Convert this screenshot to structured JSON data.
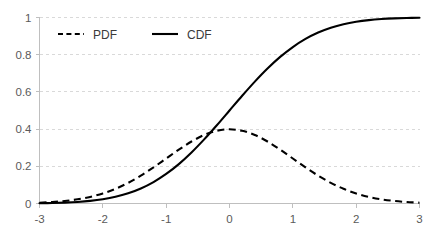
{
  "chart_data": {
    "type": "line",
    "title": "",
    "subtitle": "",
    "xlabel": "",
    "ylabel": "",
    "xlim": [
      -3,
      3
    ],
    "ylim": [
      0,
      1
    ],
    "grid": true,
    "grid_axis": "y",
    "legend_position": "top-left-inside",
    "x_ticks": [
      "-3",
      "-2",
      "-1",
      "0",
      "1",
      "2",
      "3"
    ],
    "x_tick_values": [
      -3,
      -2,
      -1,
      0,
      1,
      2,
      3
    ],
    "y_ticks": [
      "0",
      "0.2",
      "0.4",
      "0.6",
      "0.8",
      "1"
    ],
    "y_tick_values": [
      0,
      0.2,
      0.4,
      0.6,
      0.8,
      1
    ],
    "x": [
      -3,
      -2.8,
      -2.6,
      -2.4,
      -2.2,
      -2,
      -1.8,
      -1.6,
      -1.4,
      -1.2,
      -1,
      -0.8,
      -0.6,
      -0.4,
      -0.2,
      0,
      0.2,
      0.4,
      0.6,
      0.8,
      1,
      1.2,
      1.4,
      1.6,
      1.8,
      2,
      2.2,
      2.4,
      2.6,
      2.8,
      3
    ],
    "series": [
      {
        "name": "PDF",
        "style": "dashed",
        "color": "#000000",
        "values": [
          0.0044,
          0.0079,
          0.0136,
          0.0224,
          0.0355,
          0.054,
          0.079,
          0.1109,
          0.1497,
          0.1942,
          0.242,
          0.2897,
          0.3332,
          0.3683,
          0.391,
          0.3989,
          0.391,
          0.3683,
          0.3332,
          0.2897,
          0.242,
          0.1942,
          0.1497,
          0.1109,
          0.079,
          0.054,
          0.0355,
          0.0224,
          0.0136,
          0.0079,
          0.0044
        ]
      },
      {
        "name": "CDF",
        "style": "solid",
        "color": "#000000",
        "values": [
          0.0013,
          0.0026,
          0.0047,
          0.0082,
          0.0139,
          0.0228,
          0.0359,
          0.0548,
          0.0808,
          0.1151,
          0.1587,
          0.2119,
          0.2743,
          0.3446,
          0.4207,
          0.5,
          0.5793,
          0.6554,
          0.7257,
          0.7881,
          0.8413,
          0.8849,
          0.9192,
          0.9452,
          0.9641,
          0.9772,
          0.9861,
          0.9918,
          0.9953,
          0.9974,
          0.9987
        ]
      }
    ]
  },
  "legend": {
    "items": [
      {
        "label": "PDF",
        "style": "dashed"
      },
      {
        "label": "CDF",
        "style": "solid"
      }
    ]
  },
  "colors": {
    "series": "#000000",
    "gridline": "#d9d9d9",
    "axis": "#bfbfbf",
    "tick_text": "#5a5a5a",
    "legend_text": "#3a3a3a",
    "background": "#ffffff"
  }
}
